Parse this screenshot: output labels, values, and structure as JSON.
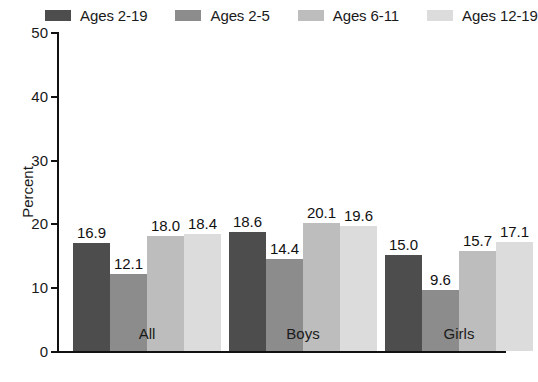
{
  "chart_data": {
    "type": "bar",
    "title": "",
    "subtitle": "",
    "xlabel": "",
    "ylabel": "Percent",
    "categories": [
      "All",
      "Boys",
      "Girls"
    ],
    "ylim": [
      0,
      50
    ],
    "yticks": [
      0,
      10,
      20,
      30,
      40,
      50
    ],
    "ytick_labels": [
      "0",
      "10",
      "20",
      "30",
      "40",
      "50"
    ],
    "grid": false,
    "legend_position": "top",
    "value_labels": true,
    "series": [
      {
        "name": "Ages 2-19",
        "color": "#4d4d4d",
        "values": [
          16.9,
          18.6,
          15.0
        ],
        "labels": [
          "16.9",
          "18.6",
          "15.0"
        ]
      },
      {
        "name": "Ages 2-5",
        "color": "#8c8c8c",
        "values": [
          12.1,
          14.4,
          9.6
        ],
        "labels": [
          "12.1",
          "14.4",
          "9.6"
        ]
      },
      {
        "name": "Ages 6-11",
        "color": "#bdbdbd",
        "values": [
          18.0,
          20.1,
          15.7
        ],
        "labels": [
          "18.0",
          "20.1",
          "15.7"
        ]
      },
      {
        "name": "Ages 12-19",
        "color": "#dcdcdc",
        "values": [
          18.4,
          19.6,
          17.1
        ],
        "labels": [
          "18.4",
          "19.6",
          "17.1"
        ]
      }
    ]
  },
  "legend": {
    "items": [
      {
        "label": "Ages 2-19",
        "color": "#4d4d4d"
      },
      {
        "label": "Ages 2-5",
        "color": "#8c8c8c"
      },
      {
        "label": "Ages 6-11",
        "color": "#bdbdbd"
      },
      {
        "label": "Ages 12-19",
        "color": "#dcdcdc"
      }
    ]
  },
  "axes": {
    "y_title": "Percent",
    "y_ticks": [
      "50",
      "40",
      "30",
      "20",
      "10",
      "0"
    ],
    "x_categories": [
      "All",
      "Boys",
      "Girls"
    ]
  }
}
